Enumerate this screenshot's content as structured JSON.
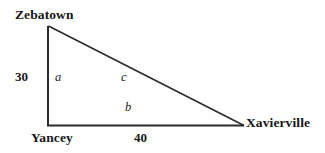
{
  "figure": {
    "type": "geometry-diagram",
    "shape": "right-triangle",
    "background_color": "#fefefe",
    "stroke_color": "#2b2b2b",
    "vertices": [
      {
        "name": "Zebatown",
        "label": "Zebatown",
        "x": 48,
        "y": 26
      },
      {
        "name": "Yancey",
        "label": "Yancey",
        "x": 48,
        "y": 126
      },
      {
        "name": "Xavierville",
        "label": "Xavierville",
        "x": 244,
        "y": 126
      }
    ],
    "sides": [
      {
        "id": "a",
        "label": "a",
        "from": "Zebatown",
        "to": "Yancey",
        "measure": "30"
      },
      {
        "id": "b",
        "label": "b",
        "from": "Yancey",
        "to": "Xavierville",
        "measure": "40"
      },
      {
        "id": "c",
        "label": "c",
        "from": "Zebatown",
        "to": "Xavierville",
        "measure": ""
      }
    ],
    "measures": {
      "vertical_leg": "30",
      "horizontal_leg": "40"
    },
    "side_labels": {
      "vertical": "a",
      "horizontal": "b",
      "hypotenuse": "c"
    }
  }
}
